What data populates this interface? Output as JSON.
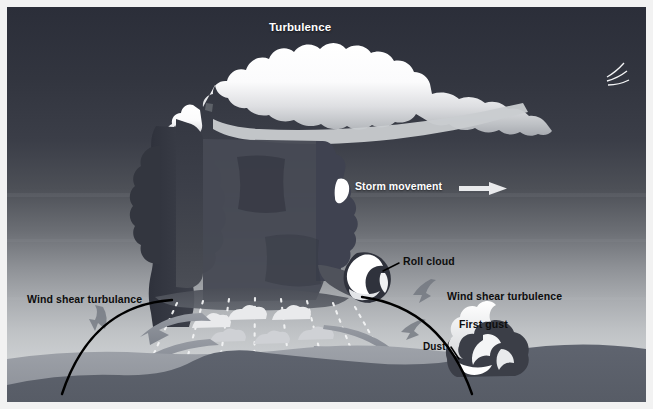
{
  "figure": {
    "kind": "thunderstorm-cross-section-diagram",
    "title_visible": false,
    "canvas": {
      "width": 653,
      "height": 409
    },
    "palette": {
      "sky_top": "#2b2e39",
      "sky_horizon": "#d5d7d9",
      "ground": "#5b616e",
      "ground_far": "#8f949c",
      "cloud_bright": "#ffffff",
      "cloud_mid": "#d9dade",
      "cloud_shadow": "#9fa3aa",
      "storm_body": "#3a3d47",
      "storm_body_light": "#4a4d57",
      "arrow_gray": "#8a8f98",
      "rain_dots": "#f4f5f6",
      "label_light": "#ffffff",
      "label_dark": "#0d0d0d",
      "pointer_line": "#000000",
      "plate_border": "#ffffff"
    }
  },
  "labels": [
    {
      "id": "turbulence",
      "text": "Turbulence",
      "color": "light",
      "anchor": "anvil-top"
    },
    {
      "id": "storm",
      "text": "Storm movement",
      "color": "light",
      "anchor": "mid-right-sky",
      "has_arrow": true,
      "arrow_direction": "right"
    },
    {
      "id": "roll-cloud",
      "text": "Roll cloud",
      "color": "dark",
      "anchor": "roll-cloud",
      "has_pointer": true
    },
    {
      "id": "shear-left",
      "text": "Wind shear turbulance",
      "color": "dark",
      "anchor": "lower-left"
    },
    {
      "id": "shear-right",
      "text": "Wind shear turbulence",
      "color": "dark",
      "anchor": "lower-right"
    },
    {
      "id": "first-gust",
      "text": "First gust",
      "color": "dark",
      "anchor": "gust-front-right"
    },
    {
      "id": "dust",
      "text": "Dust",
      "color": "dark",
      "anchor": "dust-cloud",
      "has_pointer": true
    }
  ],
  "features": {
    "anvil_cloud": {
      "name": "anvil cloud",
      "extent": "top of frame, spreading left-to-right with cirrus tail"
    },
    "updraft_tower": {
      "name": "cumulonimbus tower",
      "position": "left-of-center"
    },
    "precipitation_core": {
      "name": "rain shaft",
      "rendered_as": "white dotted vertical lines",
      "line_count": 8
    },
    "scud_clouds": {
      "name": "scud / shelf fragments",
      "count": 6
    },
    "roll_cloud": {
      "name": "roll cloud",
      "position": "right side of storm base"
    },
    "outflow_arrows_left": {
      "name": "downdraft outflow arrows",
      "direction": "left",
      "count": 2
    },
    "outflow_arrows_right": {
      "name": "downdraft outflow arrows",
      "direction": "right",
      "count": 3
    },
    "gust_front_lines": {
      "name": "gust front boundary",
      "count": 2,
      "style": "solid black curve"
    },
    "shear_arrows": {
      "name": "wind shear turbulence arrows",
      "count": 3
    },
    "dust_cloud": {
      "name": "raised dust at gust front",
      "position": "right of center, at ground"
    },
    "horizon_terrain": {
      "name": "rolling terrain",
      "layers": 2
    }
  }
}
